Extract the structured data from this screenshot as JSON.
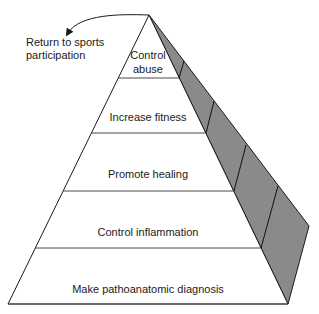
{
  "diagram": {
    "type": "pyramid",
    "levels_bottom_to_top": [
      {
        "label_lines": [
          "Make pathoanatomic diagnosis"
        ]
      },
      {
        "label_lines": [
          "Control inflammation"
        ]
      },
      {
        "label_lines": [
          "Promote healing"
        ]
      },
      {
        "label_lines": [
          "Increase fitness"
        ]
      },
      {
        "label_lines": [
          "Control",
          "abuse"
        ]
      }
    ],
    "apex_annotation": {
      "label_lines": [
        "Return to sports",
        "participation"
      ],
      "arrow": "curved arrow from apex pointing to annotation"
    },
    "colors": {
      "front_face": "#ffffff",
      "side_face": "#8a8a8a",
      "lines": "#1a1a1a",
      "text": "#1a1a1a"
    }
  }
}
